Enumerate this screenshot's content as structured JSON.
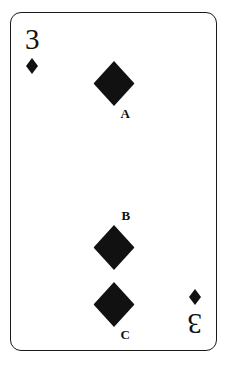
{
  "card": {
    "rank": "3",
    "suit_name": "diamond",
    "suit_color": "#111111",
    "border_color": "#1a1a1a",
    "background_color": "#ffffff",
    "corner_indices": [
      {
        "position": "top-left",
        "rank": "3",
        "suit": "diamond"
      },
      {
        "position": "bottom-right",
        "rank": "3",
        "suit": "diamond"
      }
    ],
    "pips": [
      {
        "label": "A",
        "label_position": "below-right",
        "top": 48
      },
      {
        "label": "B",
        "label_position": "above-right",
        "top": 212
      },
      {
        "label": "C",
        "label_position": "below-right",
        "top": 269
      }
    ]
  }
}
